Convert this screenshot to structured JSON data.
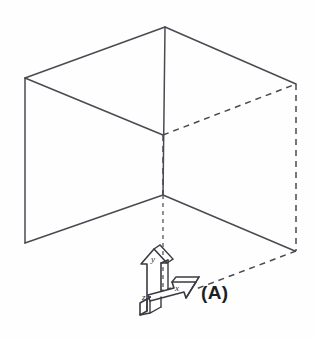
{
  "figure": {
    "caption": "(A)",
    "background_color": "#fefefe",
    "line_color": "#4a4a52",
    "arrow_fill": "#ffffff",
    "arrow_stroke": "#3a3a40",
    "width": 316,
    "height": 339
  },
  "axes": {
    "x_label": "x",
    "y_label": "y",
    "z_label": "z",
    "origin_name": "axis-origin",
    "style": "3d-block-arrows"
  },
  "geometry": {
    "type": "wireframe",
    "projection": "isometric",
    "vertices": {
      "top_peak": [
        165,
        27
      ],
      "top_left": [
        25,
        78
      ],
      "top_right": [
        296,
        84
      ],
      "back_top": [
        296,
        84
      ],
      "inner_top": [
        163,
        135
      ],
      "center": [
        163,
        195
      ],
      "bottom_left": [
        25,
        243
      ],
      "bottom_right": [
        295,
        251
      ],
      "back_bottom": [
        296,
        251
      ]
    },
    "solid_edges": [
      "top_left -> top_peak",
      "top_peak -> top_right",
      "top_left -> inner_top",
      "inner_top -> top_right_dashed",
      "top_peak -> center (vertical)",
      "top_left -> bottom_left (vertical)",
      "bottom_left -> center",
      "center -> bottom_right"
    ],
    "dashed_edges": [
      "inner_top -> top_right",
      "inner_top -> center (vertical)",
      "top_right -> back_bottom (vertical)",
      "back_bottom -> origin region"
    ]
  }
}
